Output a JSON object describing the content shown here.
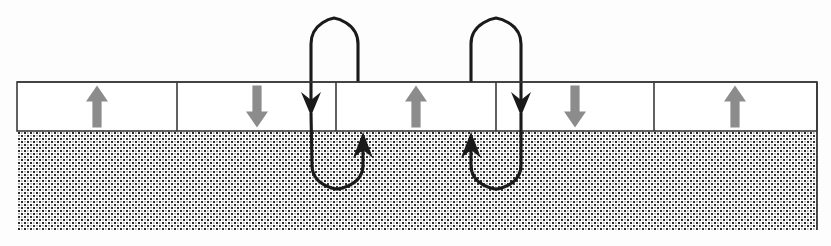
{
  "figure": {
    "title": "Magnetic domain strip with two hairpin flux loops",
    "type": "diagram",
    "canvas": {
      "width": 831,
      "height": 246
    },
    "background_color": "#fdfdfd"
  },
  "colors": {
    "outline": "#3a3a3a",
    "domain_fill": "#ffffff",
    "domain_arrow": "#8c8c8c",
    "substrate_dot": "#262626",
    "substrate_base": "#ffffff",
    "loop_stroke": "#1a1a1a"
  },
  "strip": {
    "label": "domain-strip",
    "left": 17,
    "right": 817,
    "top": 82,
    "bottom": 131,
    "border_width": 1.6
  },
  "substrate": {
    "label": "substrate-hatched-region",
    "left": 17,
    "right": 817,
    "top": 131,
    "bottom": 230,
    "pattern": "fine-stipple"
  },
  "domains": [
    {
      "index": 0,
      "name": "domain-cell-1",
      "x_start": 17,
      "x_end": 177,
      "arrow_direction": "up",
      "arrow_glyph": "↑",
      "arrow_cx": 97,
      "polarity": "+"
    },
    {
      "index": 1,
      "name": "domain-cell-2",
      "x_start": 177,
      "x_end": 336,
      "arrow_direction": "down",
      "arrow_glyph": "↓",
      "arrow_cx": 257,
      "polarity": "−"
    },
    {
      "index": 2,
      "name": "domain-cell-3",
      "x_start": 336,
      "x_end": 496,
      "arrow_direction": "up",
      "arrow_glyph": "↑",
      "arrow_cx": 416,
      "polarity": "+"
    },
    {
      "index": 3,
      "name": "domain-cell-4",
      "x_start": 496,
      "x_end": 654,
      "arrow_direction": "down",
      "arrow_glyph": "↓",
      "arrow_cx": 575,
      "polarity": "−"
    },
    {
      "index": 4,
      "name": "domain-cell-5",
      "x_start": 654,
      "x_end": 817,
      "arrow_direction": "up",
      "arrow_glyph": "↑",
      "arrow_cx": 735,
      "polarity": "+"
    }
  ],
  "domain_walls": [
    {
      "name": "domain-wall-1",
      "x": 177
    },
    {
      "name": "domain-wall-2",
      "x": 336
    },
    {
      "name": "domain-wall-3",
      "x": 496
    },
    {
      "name": "domain-wall-4",
      "x": 654
    }
  ],
  "flux_loops": [
    {
      "name": "flux-loop-1",
      "upper_arch": {
        "name": "upper-arch-1",
        "left_x": 311,
        "right_x": 358,
        "apex_y": 18,
        "base_y": 82,
        "arrow_at": "left-bottom",
        "arrow_direction": "down",
        "arrow_tip_y": 113
      },
      "lower_loop": {
        "name": "lower-loop-1",
        "left_x": 312,
        "right_x": 363,
        "nadir_y": 188,
        "base_y": 113,
        "arrow_at": "right-top",
        "arrow_direction": "up",
        "arrow_tip_y": 132
      }
    },
    {
      "name": "flux-loop-2",
      "upper_arch": {
        "name": "upper-arch-2",
        "left_x": 471,
        "right_x": 521,
        "apex_y": 18,
        "base_y": 82,
        "arrow_at": "right-bottom",
        "arrow_direction": "down",
        "arrow_tip_y": 113
      },
      "lower_loop": {
        "name": "lower-loop-2",
        "left_x": 471,
        "right_x": 521,
        "nadir_y": 188,
        "base_y": 113,
        "arrow_at": "left-top",
        "arrow_direction": "up",
        "arrow_tip_y": 132
      }
    }
  ]
}
